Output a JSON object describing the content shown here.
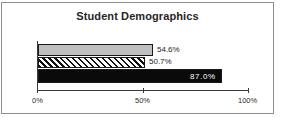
{
  "chart_data": {
    "type": "bar",
    "orientation": "horizontal",
    "title": "Student Demographics",
    "xlabel": "",
    "ylabel": "",
    "categories": [
      "series-1",
      "series-2",
      "series-3"
    ],
    "values": [
      54.6,
      50.7,
      87.0
    ],
    "data_labels": [
      "54.6%",
      "50.7%",
      "87.0%"
    ],
    "xlim": [
      0,
      100
    ],
    "xticks": [
      0,
      50,
      100
    ],
    "xtick_labels": [
      "0%",
      "50%",
      "100%"
    ],
    "grid": false,
    "legend": "none",
    "series_styles": [
      {
        "name": "bar-1",
        "fill": "light-gray",
        "color": "#bfbfbf",
        "edge": "#1a1a1a",
        "label_position": "outside"
      },
      {
        "name": "bar-2",
        "fill": "diagonal-hatch",
        "color": "#ffffff",
        "edge": "#111111",
        "label_position": "outside"
      },
      {
        "name": "bar-3",
        "fill": "solid-black",
        "color": "#0a0a0a",
        "edge": "#1a1a1a",
        "label_position": "inside"
      }
    ]
  },
  "frame": {
    "border_color": "#8e8e8e",
    "background": "#ffffff"
  },
  "axis": {
    "line_color": "#3a3a3a"
  }
}
